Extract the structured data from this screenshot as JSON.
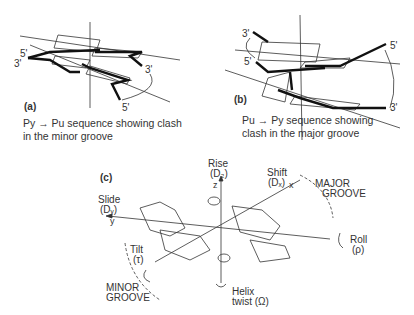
{
  "panel_a": {
    "label": "(a)",
    "caption_line1": "Py → Pu sequence showing clash",
    "caption_line2": "in the minor groove",
    "ends": {
      "top_left": "5'",
      "left": "3'",
      "right": "3'",
      "bottom": "5'"
    },
    "bases": [
      "G",
      "C",
      "C",
      "C"
    ]
  },
  "panel_b": {
    "label": "(b)",
    "caption_line1": "Pu → Py sequence showing",
    "caption_line2": "clash in the major groove",
    "ends": {
      "top_left": "3'",
      "left": "5'",
      "top_right": "5'",
      "bottom_right": "3'"
    },
    "bases": [
      "G",
      "C",
      "C",
      "G"
    ]
  },
  "panel_c": {
    "label": "(c)",
    "rise": "Rise",
    "rise_sym": "(D₂)",
    "z": "z",
    "shift": "Shift",
    "shift_sym": "(Dₓ)",
    "x": "x",
    "slide": "Slide",
    "slide_sym": "(Dᵧ)",
    "y": "y",
    "major1": "MAJOR",
    "major2": "GROOVE",
    "roll": "Roll",
    "roll_sym": "(ρ)",
    "tilt": "Tilt",
    "tilt_sym": "(τ)",
    "minor1": "MINOR",
    "minor2": "GROOVE",
    "helix1": "Helix",
    "helix2": "twist (Ω)"
  }
}
